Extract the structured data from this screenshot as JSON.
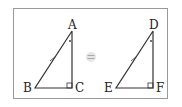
{
  "figure": {
    "left_triangle": {
      "vertices": [
        "A",
        "B",
        "C"
      ],
      "right_angle_at": "C",
      "angle_mark_at": "A",
      "tick_on": "AB"
    },
    "relation_symbol": "≡",
    "right_triangle": {
      "vertices": [
        "D",
        "E",
        "F"
      ],
      "right_angle_at": "F",
      "angle_mark_at": "D",
      "tick_on": "DE"
    },
    "colors": {
      "stroke": "#333333",
      "frame": "#9a9a9a",
      "equals": "#bdbdbd"
    }
  }
}
